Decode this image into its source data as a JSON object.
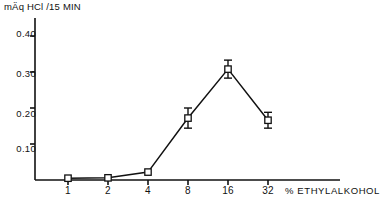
{
  "chart_data": {
    "type": "line",
    "title": "mÄq HCl /15 MIN",
    "xlabel": "% ETHYLALKOHOL",
    "ylabel": "mÄq HCl /15 MIN",
    "categories": [
      "1",
      "2",
      "4",
      "8",
      "16",
      "32"
    ],
    "x": [
      1,
      2,
      4,
      8,
      16,
      32
    ],
    "values": [
      0.005,
      0.006,
      0.022,
      0.172,
      0.308,
      0.166
    ],
    "errors": [
      0.0,
      0.0,
      0.0,
      0.028,
      0.025,
      0.022
    ],
    "series": [
      {
        "name": "HCl output",
        "values": [
          0.005,
          0.006,
          0.022,
          0.172,
          0.308,
          0.166
        ],
        "errors": [
          0.0,
          0.0,
          0.0,
          0.028,
          0.025,
          0.022
        ]
      }
    ],
    "ytick_labels": [
      "0.10",
      "0.20",
      "0.30",
      "0.40"
    ],
    "ytick_values": [
      0.1,
      0.2,
      0.3,
      0.4
    ],
    "ylim": [
      0.0,
      0.45
    ],
    "xtick_labels": [
      "1",
      "2",
      "4",
      "8",
      "16",
      "32"
    ],
    "grid": false,
    "legend": "none",
    "marker": "open-square",
    "line_color": "#111111"
  },
  "axes": {
    "y_title": "mÄq HCl /15 MIN",
    "x_caption": "% ETHYLALKOHOL",
    "ytick_labels": [
      "0.40",
      "0.30",
      "0.20",
      "0.10"
    ],
    "xtick_labels": [
      "1",
      "2",
      "4",
      "8",
      "16",
      "32"
    ]
  }
}
